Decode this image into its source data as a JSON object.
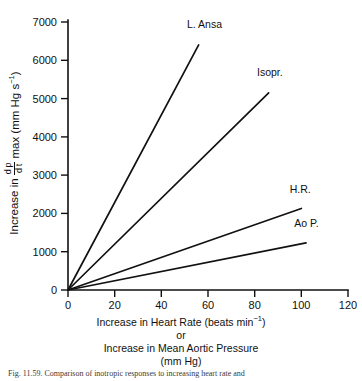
{
  "chart_data": {
    "type": "line",
    "title": "",
    "xlabel_lines": [
      "Increase in Heart Rate (beats min⁻¹)",
      "or",
      "Increase in Mean Aortic Pressure",
      "(mm Hg)"
    ],
    "ylabel": "Increase in dp/dt max (mm Hg s⁻¹)",
    "xlim": [
      0,
      120
    ],
    "ylim": [
      0,
      7000
    ],
    "xticks": [
      0,
      20,
      40,
      60,
      80,
      100,
      120
    ],
    "yticks": [
      0,
      1000,
      2000,
      3000,
      4000,
      5000,
      6000,
      7000
    ],
    "xticklabels": [
      "0",
      "20",
      "40",
      "60",
      "80",
      "100",
      "120"
    ],
    "yticklabels": [
      "0",
      "1000",
      "2000",
      "3000",
      "4000",
      "5000",
      "6000",
      "7000"
    ],
    "grid": false,
    "legend_position": "inline-end-of-line",
    "series": [
      {
        "name": "L. Ansa",
        "label": "L. Ansa",
        "x": [
          0,
          56
        ],
        "y": [
          0,
          6400
        ],
        "slope": 114.3,
        "label_x": 57,
        "label_y": 6850
      },
      {
        "name": "Isopr.",
        "label": "Isopr.",
        "x": [
          0,
          86
        ],
        "y": [
          0,
          5150
        ],
        "slope": 59.9,
        "label_x": 87,
        "label_y": 5600
      },
      {
        "name": "H.R.",
        "label": "H.R.",
        "x": [
          0,
          100
        ],
        "y": [
          0,
          2130
        ],
        "slope": 21.3,
        "label_x": 101,
        "label_y": 2530
      },
      {
        "name": "Ao P.",
        "label": "Ao P.",
        "x": [
          0,
          102
        ],
        "y": [
          0,
          1230
        ],
        "slope": 12.1,
        "label_x": 103,
        "label_y": 1640
      }
    ]
  },
  "yaxis_title_parts": {
    "lead": "Increase in",
    "frac_numerator": "d p",
    "frac_denominator": "d t",
    "trail": "max (mm Hg s",
    "exponent": "−1",
    "close": ")"
  },
  "xaxis_title_parts": {
    "line1_pre": "Increase in Heart Rate (beats min",
    "line1_exp": "−1",
    "line1_post": ")",
    "line2": "or",
    "line3": "Increase in Mean Aortic Pressure",
    "line4": "(mm Hg)"
  },
  "caption": "Fig. 11.59. Comparison of inotropic responses to increasing heart rate and"
}
